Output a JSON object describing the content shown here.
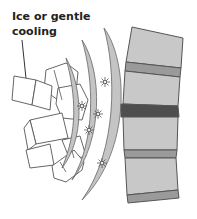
{
  "illustration": {
    "label_line1": "Ice or gentle",
    "label_line2": "cooling",
    "colors": {
      "background": "#ffffff",
      "outline": "#555555",
      "vertebra": "#c8c8c8",
      "disc": "#9a9a9a",
      "injured_disc": "#4e4e4e",
      "cold_wave": "#c4c4c4",
      "ice": "#ffffff"
    },
    "parts": [
      "ice-cubes",
      "cold-waves",
      "sparkles",
      "spine-segment",
      "injured-disc"
    ]
  }
}
